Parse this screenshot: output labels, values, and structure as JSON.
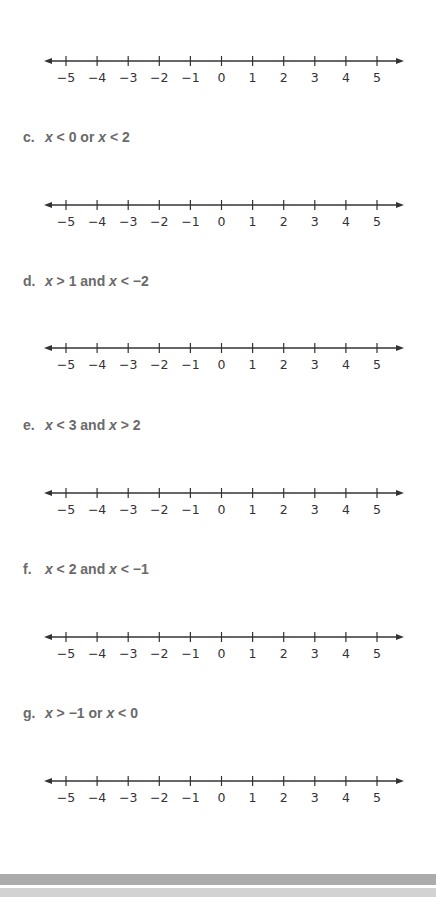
{
  "numberline": {
    "ticks": [
      "−5",
      "−4",
      "−3",
      "−2",
      "−1",
      "0",
      "1",
      "2",
      "3",
      "4",
      "5"
    ]
  },
  "problems": [
    {
      "letter": "c.",
      "var1": "x",
      "op1": " < 0 ",
      "conj": "or",
      "var2": " x",
      "op2": " < 2"
    },
    {
      "letter": "d.",
      "var1": "x",
      "op1": " > 1 ",
      "conj": "and",
      "var2": " x",
      "op2": " < −2"
    },
    {
      "letter": "e.",
      "var1": "x",
      "op1": " < 3 ",
      "conj": "and",
      "var2": " x",
      "op2": " > 2"
    },
    {
      "letter": "f.",
      "var1": "x",
      "op1": " < 2 ",
      "conj": "and",
      "var2": " x",
      "op2": " < −1"
    },
    {
      "letter": "g.",
      "var1": "x",
      "op1": " > −1 ",
      "conj": "or",
      "var2": " x",
      "op2": " < 0"
    }
  ],
  "colors": {
    "line": "#333333",
    "label_text": "#6a6a6a",
    "footer_dark": "#ababab",
    "footer_light": "#d2d2d2"
  }
}
